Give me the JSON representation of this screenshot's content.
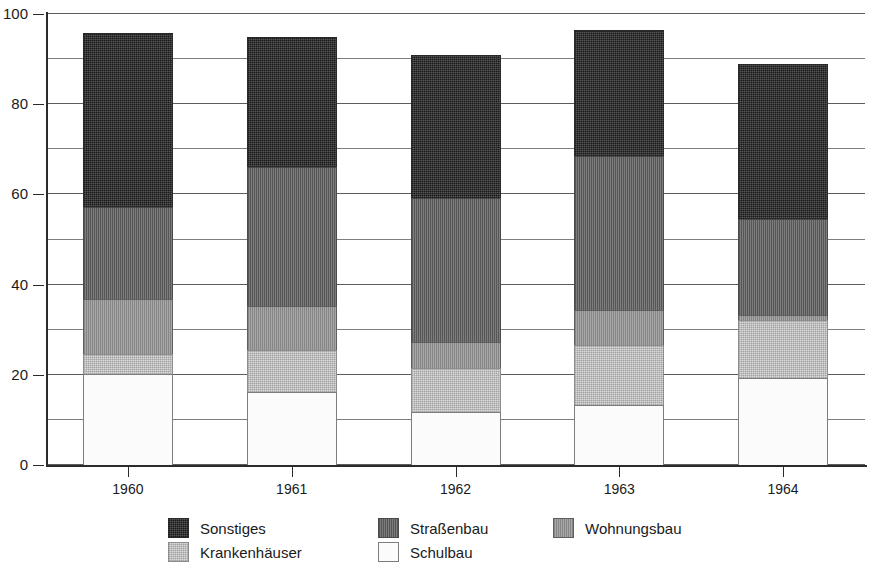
{
  "chart_data": {
    "type": "bar",
    "stacked": true,
    "title": "",
    "subtitle": "",
    "xlabel": "",
    "ylabel": "",
    "categories": [
      "1960",
      "1961",
      "1962",
      "1963",
      "1964"
    ],
    "ylim": [
      0,
      100
    ],
    "yticks": [
      0,
      20,
      40,
      60,
      80,
      100
    ],
    "ytick_labels": [
      "0",
      "20",
      "40",
      "60",
      "80",
      "100"
    ],
    "gridlines": [
      0,
      10,
      20,
      30,
      40,
      50,
      60,
      70,
      80,
      90,
      100
    ],
    "grid": true,
    "legend_position": "bottom",
    "series": [
      {
        "name": "Schulbau",
        "values": [
          20.5,
          16.5,
          12.0,
          13.5,
          19.5
        ],
        "color": "#fbfbfb"
      },
      {
        "name": "Krankenhäuser",
        "values": [
          4.5,
          9.5,
          10.0,
          13.5,
          13.0
        ],
        "color": "#c9c9c9"
      },
      {
        "name": "Wohnungsbau",
        "values": [
          12.5,
          10.0,
          6.0,
          8.0,
          1.5
        ],
        "color": "#9a9a9a"
      },
      {
        "name": "Straßenbau",
        "values": [
          20.5,
          31.0,
          32.0,
          34.5,
          21.5
        ],
        "color": "#6e6e6e"
      },
      {
        "name": "Sonstiges",
        "values": [
          39.0,
          29.0,
          32.0,
          28.0,
          34.5
        ],
        "color": "#3a3a3a"
      }
    ],
    "totals": [
      97.0,
      96.0,
      92.0,
      97.5,
      90.0
    ]
  },
  "legend": {
    "entries": [
      {
        "label": "Sonstiges",
        "icon": "legend-swatch-sonstiges"
      },
      {
        "label": "Straßenbau",
        "icon": "legend-swatch-strassenbau"
      },
      {
        "label": "Wohnungsbau",
        "icon": "legend-swatch-wohnungsbau"
      },
      {
        "label": "Krankenhäuser",
        "icon": "legend-swatch-krankenhaeuser"
      },
      {
        "label": "Schulbau",
        "icon": "legend-swatch-schulbau"
      }
    ]
  }
}
